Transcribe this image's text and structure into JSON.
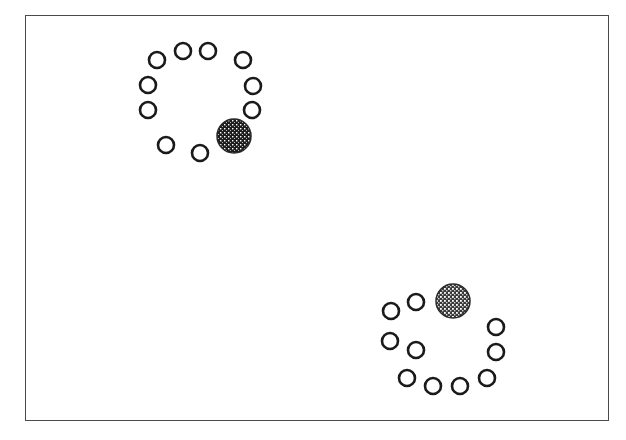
{
  "figure": {
    "frame": {
      "x": 25,
      "y": 15,
      "width": 584,
      "height": 406,
      "stroke": "#4a4a4a"
    },
    "styles": {
      "open_circle_radius": 8,
      "open_circle_stroke": "#1a1a1a",
      "open_circle_stroke_width": 2.6,
      "filled_circle_radius": 17,
      "filled_circle_color": "#2a2a2a",
      "filled_pattern": "crosshatch"
    },
    "clusters": [
      {
        "name": "top-left-cluster",
        "open_circles": [
          {
            "x": 157,
            "y": 60
          },
          {
            "x": 183,
            "y": 51
          },
          {
            "x": 208,
            "y": 51
          },
          {
            "x": 243,
            "y": 60
          },
          {
            "x": 253,
            "y": 86
          },
          {
            "x": 252,
            "y": 110
          },
          {
            "x": 148,
            "y": 85
          },
          {
            "x": 148,
            "y": 110
          },
          {
            "x": 166,
            "y": 145
          },
          {
            "x": 200,
            "y": 153
          }
        ],
        "filled_circle": {
          "x": 234,
          "y": 136,
          "shade": "dark"
        }
      },
      {
        "name": "bottom-right-cluster",
        "open_circles": [
          {
            "x": 391,
            "y": 311
          },
          {
            "x": 416,
            "y": 302
          },
          {
            "x": 496,
            "y": 327
          },
          {
            "x": 390,
            "y": 341
          },
          {
            "x": 416,
            "y": 350
          },
          {
            "x": 496,
            "y": 352
          },
          {
            "x": 407,
            "y": 378
          },
          {
            "x": 433,
            "y": 386
          },
          {
            "x": 460,
            "y": 386
          },
          {
            "x": 487,
            "y": 378
          }
        ],
        "filled_circle": {
          "x": 453,
          "y": 301,
          "shade": "medium"
        }
      }
    ]
  },
  "caption": {
    "text": ""
  }
}
